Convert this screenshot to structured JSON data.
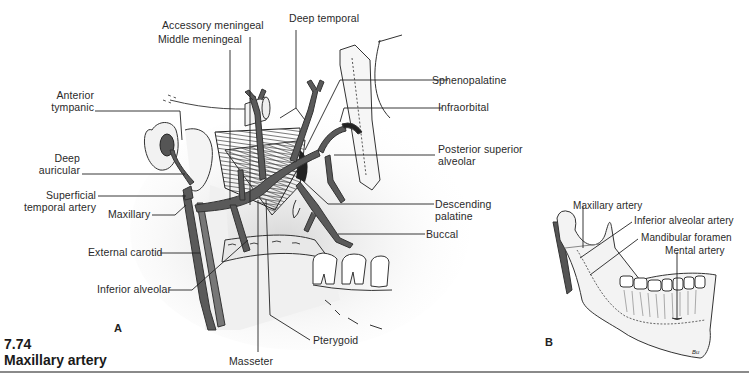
{
  "figure": {
    "number": "7.74",
    "title": "Maxillary artery"
  },
  "panels": {
    "a": {
      "letter": "A",
      "labels": {
        "accessory_meningeal": "Accessory meningeal",
        "middle_meningeal": "Middle meningeal",
        "deep_temporal": "Deep temporal",
        "sphenopalatine": "Sphenopalatine",
        "infraorbital": "Infraorbital",
        "anterior_tympanic_1": "Anterior",
        "anterior_tympanic_2": "tympanic",
        "deep_auricular_1": "Deep",
        "deep_auricular_2": "auricular",
        "posterior_superior_alveolar_1": "Posterior superior",
        "posterior_superior_alveolar_2": "alveolar",
        "superficial_temporal_1": "Superficial",
        "superficial_temporal_2": "temporal artery",
        "maxillary": "Maxillary",
        "descending_palatine_1": "Descending",
        "descending_palatine_2": "palatine",
        "buccal": "Buccal",
        "external_carotid": "External carotid",
        "inferior_alveolar": "Inferior alveolar",
        "pterygoid": "Pterygoid",
        "masseter": "Masseter"
      }
    },
    "b": {
      "letter": "B",
      "labels": {
        "maxillary_artery": "Maxillary artery",
        "inferior_alveolar_artery": "Inferior alveolar artery",
        "mandibular_foramen": "Mandibular foramen",
        "mental_artery": "Mental artery"
      },
      "signature": "Bu"
    }
  },
  "colors": {
    "artery": "#5a5a5a",
    "artery_dark": "#3a3a3a",
    "leader": "#222222",
    "bone_fill": "#f2f2f2",
    "shade": "#dcdcdc",
    "rule": "#8a8a8a"
  }
}
